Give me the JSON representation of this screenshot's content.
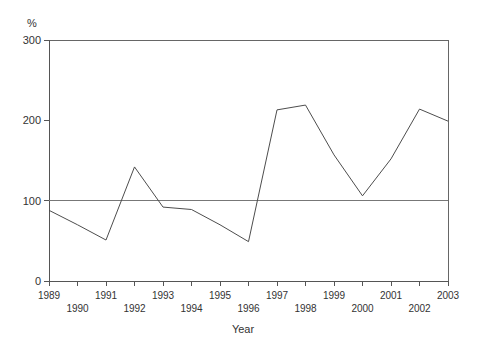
{
  "chart_data": {
    "type": "line",
    "title": "",
    "xlabel": "Year",
    "ylabel": "%",
    "ylim": [
      0,
      300
    ],
    "xlim": [
      1989,
      2003
    ],
    "yticks": [
      0,
      100,
      200,
      300
    ],
    "ytick_labels": [
      "0",
      "100",
      "200",
      "300"
    ],
    "grid": false,
    "legend": null,
    "legend_position": "none",
    "x": [
      1989,
      1990,
      1991,
      1992,
      1993,
      1994,
      1995,
      1996,
      1997,
      1998,
      1999,
      2000,
      2001,
      2002,
      2003
    ],
    "categories": [
      "1989",
      "1990",
      "1991",
      "1992",
      "1993",
      "1994",
      "1995",
      "1996",
      "1997",
      "1998",
      "1999",
      "2000",
      "2001",
      "2002",
      "2003"
    ],
    "xtick_labels_top_row": [
      "1989",
      "1991",
      "1993",
      "1995",
      "1997",
      "1999",
      "2001",
      "2003"
    ],
    "xtick_labels_bottom_row": [
      "1990",
      "1992",
      "1994",
      "1996",
      "1998",
      "2000",
      "2002"
    ],
    "values": [
      88,
      70,
      51,
      142,
      92,
      89,
      70,
      49,
      213,
      219,
      157,
      106,
      152,
      214,
      199
    ],
    "reference_line": {
      "value": 100,
      "orientation": "horizontal",
      "label": ""
    },
    "annotations": []
  },
  "axes": {
    "y_unit_label": "%",
    "x_title": "Year"
  },
  "colors": {
    "data_line": "#4d4d4d",
    "axis": "#555555",
    "frame": "#666666",
    "reference_line": "#777777",
    "background": "#ffffff",
    "text": "#333333"
  }
}
